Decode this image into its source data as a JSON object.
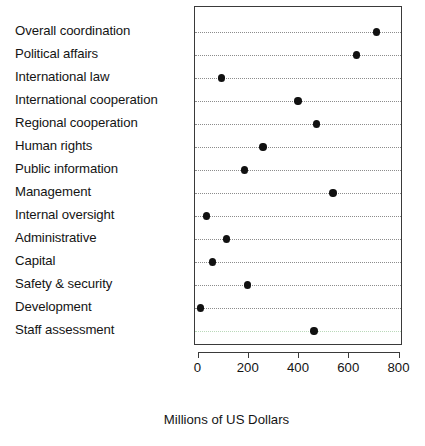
{
  "chart_data": {
    "type": "scatter",
    "subtype": "cleveland-dot-plot",
    "title": "",
    "xlabel": "Millions of US Dollars",
    "ylabel": "",
    "xlim": [
      0,
      800
    ],
    "ylim": [
      0,
      15
    ],
    "xticks": [
      0,
      200,
      400,
      600,
      800
    ],
    "xticklabels": [
      "0",
      "200",
      "400",
      "600",
      "800"
    ],
    "grid": "horizontal dotted gridlines per category",
    "legend": "none",
    "orientation": "horizontal",
    "marker": "filled circle",
    "marker_color": "#111111",
    "categories": [
      "Overall coordination",
      "Political affairs",
      "International law",
      "International cooperation",
      "Regional cooperation",
      "Human rights",
      "Public information",
      "Management",
      "Internal oversight",
      "Administrative",
      "Capital",
      "Safety & security",
      "Development",
      "Staff assessment"
    ],
    "values": [
      708,
      628,
      92,
      396,
      470,
      256,
      184,
      536,
      32,
      112,
      56,
      196,
      8,
      460
    ],
    "points": [
      {
        "category": "Overall coordination",
        "value": 708
      },
      {
        "category": "Political affairs",
        "value": 628
      },
      {
        "category": "International law",
        "value": 92
      },
      {
        "category": "International cooperation",
        "value": 396
      },
      {
        "category": "Regional cooperation",
        "value": 470
      },
      {
        "category": "Human rights",
        "value": 256
      },
      {
        "category": "Public information",
        "value": 184
      },
      {
        "category": "Management",
        "value": 536
      },
      {
        "category": "Internal oversight",
        "value": 32
      },
      {
        "category": "Administrative",
        "value": 112
      },
      {
        "category": "Capital",
        "value": 56
      },
      {
        "category": "Safety & security",
        "value": 196
      },
      {
        "category": "Development",
        "value": 8
      },
      {
        "category": "Staff assessment",
        "value": 460
      }
    ]
  },
  "axis": {
    "x_title": "Millions of US Dollars"
  },
  "colors": {
    "marker": "#111111",
    "grid": "#8c8c8c",
    "frame": "#3a3a3a",
    "text": "#141414",
    "background": "#ffffff"
  }
}
